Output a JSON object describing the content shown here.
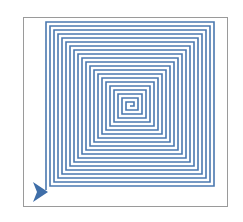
{
  "figure": {
    "kind": "turtle-graphics square spiral",
    "line_color": "#4a78b0",
    "turtle_color": "#3f6ea8",
    "frame_color": "#9a9a9a",
    "background": "#ffffff"
  },
  "spiral": {
    "center_x": 130,
    "center_y": 106,
    "step": 4,
    "segments": 84,
    "stroke_width": 1.6
  },
  "turtle": {
    "x": 40,
    "y": 192,
    "heading": "right",
    "icon": "turtle-arrow-icon"
  }
}
